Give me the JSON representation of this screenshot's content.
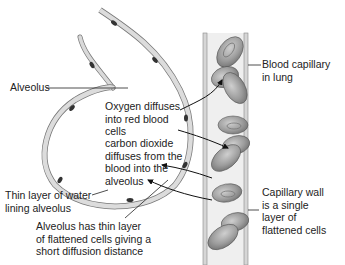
{
  "diagram": {
    "labels": {
      "alveolus": "Alveolus",
      "blood_capillary": "Blood capillary\nin lung",
      "oxygen_diffuses": "Oxygen diffuses\ninto red blood\ncells",
      "co2_diffuses": "carbon dioxide\ndiffuses from the\nblood into the\nalveolus",
      "water_layer": "Thin layer of water\nlining alveolus",
      "capillary_wall": "Capillary wall\nis a single\nlayer of\nflattened cells",
      "alveolus_wall": "Alveolus has thin layer\nof flattened cells giving a\nshort diffusion distance"
    },
    "colors": {
      "cell_wall": "#d8d8d8",
      "cell_outline": "#666666",
      "nucleus": "#333333",
      "capillary_fill": "#ececec",
      "red_blood_cell": "#9a9a9a",
      "label_text": "#222222",
      "leader_line": "#222222"
    }
  }
}
